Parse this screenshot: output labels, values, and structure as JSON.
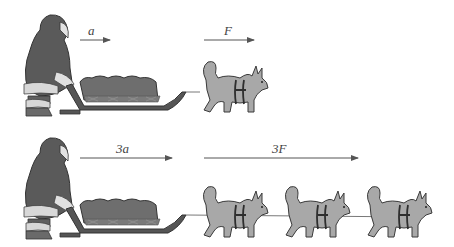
{
  "scenes": {
    "top": {
      "accel_label": "a",
      "force_label": "F",
      "dog_count": 1
    },
    "bottom": {
      "accel_label": "3a",
      "force_label": "3F",
      "dog_count": 3
    }
  },
  "colors": {
    "parka": "#5a5a5a",
    "fur_trim": "#d8d8d8",
    "sled_body": "#6e6e6e",
    "sled_frame": "#4a4a4a",
    "dog": "#a8a8a8",
    "dog_outline": "#3a3a3a",
    "harness": "#2e2e2e",
    "arrow": "#555555"
  }
}
